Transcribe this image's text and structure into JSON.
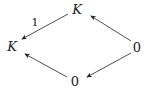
{
  "diagram": {
    "type": "commutative-diagram",
    "nodes": [
      {
        "id": "top",
        "label": "K",
        "italic": true,
        "x": 77,
        "y": 9
      },
      {
        "id": "left",
        "label": "K",
        "italic": true,
        "x": 12,
        "y": 46
      },
      {
        "id": "right",
        "label": "0",
        "italic": false,
        "x": 137,
        "y": 47
      },
      {
        "id": "bottom",
        "label": "0",
        "italic": false,
        "x": 75,
        "y": 81
      }
    ],
    "edges": [
      {
        "from": "top",
        "to": "left",
        "label": "1"
      },
      {
        "from": "right",
        "to": "top",
        "label": ""
      },
      {
        "from": "right",
        "to": "bottom",
        "label": ""
      },
      {
        "from": "bottom",
        "to": "left",
        "label": ""
      }
    ],
    "edge_label_1": "1"
  }
}
